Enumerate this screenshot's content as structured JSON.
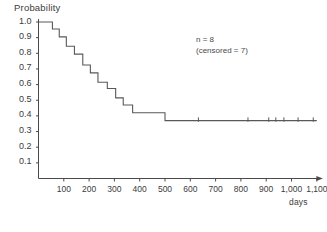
{
  "chart_data": {
    "type": "line",
    "subtype": "kaplan-meier-step",
    "title": "",
    "xlabel": "days",
    "ylabel": "Probability",
    "xlim": [
      0,
      1150
    ],
    "ylim": [
      0.0,
      1.05
    ],
    "grid": false,
    "legend": "none",
    "x_ticks": [
      100,
      200,
      300,
      400,
      500,
      600,
      700,
      800,
      900,
      1000,
      1100
    ],
    "x_tick_labels": [
      "100",
      "200",
      "300",
      "400",
      "500",
      "600",
      "700",
      "800",
      "900",
      "1,000",
      "1,100"
    ],
    "y_ticks": [
      0.1,
      0.2,
      0.3,
      0.4,
      0.5,
      0.6,
      0.7,
      0.8,
      0.9,
      1.0
    ],
    "y_tick_labels": [
      "0.1",
      "0.2",
      "0.3",
      "0.4",
      "0.5",
      "0.6",
      "0.7",
      "0.8",
      "0.9",
      "1.0"
    ],
    "annotations": [
      {
        "text": "n = 8",
        "x": 640,
        "y": 0.8
      },
      {
        "text": "(censored = 7)",
        "x": 640,
        "y": 0.74
      }
    ],
    "step_points": [
      {
        "x": 0,
        "y": 1.0
      },
      {
        "x": 55,
        "y": 1.0
      },
      {
        "x": 55,
        "y": 0.955
      },
      {
        "x": 82,
        "y": 0.955
      },
      {
        "x": 82,
        "y": 0.905
      },
      {
        "x": 110,
        "y": 0.905
      },
      {
        "x": 110,
        "y": 0.845
      },
      {
        "x": 142,
        "y": 0.845
      },
      {
        "x": 142,
        "y": 0.795
      },
      {
        "x": 175,
        "y": 0.795
      },
      {
        "x": 175,
        "y": 0.725
      },
      {
        "x": 205,
        "y": 0.725
      },
      {
        "x": 205,
        "y": 0.675
      },
      {
        "x": 235,
        "y": 0.675
      },
      {
        "x": 235,
        "y": 0.615
      },
      {
        "x": 272,
        "y": 0.615
      },
      {
        "x": 272,
        "y": 0.575
      },
      {
        "x": 305,
        "y": 0.575
      },
      {
        "x": 305,
        "y": 0.515
      },
      {
        "x": 335,
        "y": 0.515
      },
      {
        "x": 335,
        "y": 0.47
      },
      {
        "x": 372,
        "y": 0.47
      },
      {
        "x": 372,
        "y": 0.42
      },
      {
        "x": 500,
        "y": 0.42
      },
      {
        "x": 500,
        "y": 0.37
      },
      {
        "x": 1100,
        "y": 0.37
      }
    ],
    "censor_marks": [
      {
        "x": 632,
        "y": 0.37
      },
      {
        "x": 828,
        "y": 0.37
      },
      {
        "x": 910,
        "y": 0.37
      },
      {
        "x": 938,
        "y": 0.37
      },
      {
        "x": 970,
        "y": 0.37
      },
      {
        "x": 1026,
        "y": 0.37
      },
      {
        "x": 1086,
        "y": 0.37
      }
    ],
    "series_color": "#595959",
    "axis_color": "#4a4a4a"
  },
  "figure": {
    "ylabel": "Probability",
    "xlabel": "days",
    "annotation_line1": "n = 8",
    "annotation_line2": "(censored = 7)",
    "caption": ""
  }
}
